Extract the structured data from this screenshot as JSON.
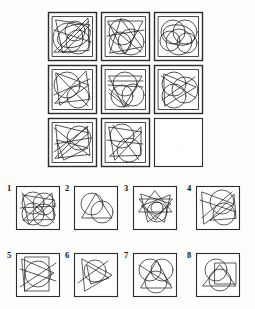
{
  "puzzle": {
    "type": "visual-analogy-matrix",
    "title": "Raven-style progressive matrix with eight answer options",
    "stroke_color": "#1d1d1d",
    "box_fill": "#ffffff",
    "background_color": "#fdfdfb",
    "matrix": {
      "rows": 3,
      "cols": 3,
      "origin": {
        "x": 48,
        "y": 12
      },
      "cell_size": 49,
      "gap": 4,
      "cells": [
        {
          "id": "r1c1",
          "row": 1,
          "col": 1,
          "empty": false,
          "description": "Dense overlay: large square border, big left circle, two mid circles, downward triangle and long diagonals",
          "shapes": [
            {
              "kind": "rect",
              "x": 5,
              "y": 5,
              "w": 39,
              "h": 39
            },
            {
              "kind": "circle",
              "cx": 20,
              "cy": 26,
              "r": 15
            },
            {
              "kind": "circle",
              "cx": 30,
              "cy": 30,
              "r": 12
            },
            {
              "kind": "circle",
              "cx": 27,
              "cy": 19,
              "r": 10
            },
            {
              "kind": "ellipse",
              "cx": 26,
              "cy": 24,
              "rx": 17,
              "ry": 11,
              "rot": -18
            },
            {
              "kind": "poly",
              "pts": "8,8 42,13 15,41"
            },
            {
              "kind": "poly",
              "pts": "6,40 40,6 41,38"
            },
            {
              "kind": "line",
              "x1": 6,
              "y1": 18,
              "x2": 43,
              "y2": 30
            },
            {
              "kind": "line",
              "x1": 10,
              "y1": 40,
              "x2": 41,
              "y2": 9
            }
          ]
        },
        {
          "id": "r1c2",
          "row": 1,
          "col": 2,
          "empty": false,
          "description": "Square with three large overlapping circles, an inverted triangle and crossing chords",
          "shapes": [
            {
              "kind": "rect",
              "x": 5,
              "y": 5,
              "w": 39,
              "h": 39
            },
            {
              "kind": "circle",
              "cx": 21,
              "cy": 20,
              "r": 13
            },
            {
              "kind": "circle",
              "cx": 30,
              "cy": 30,
              "r": 13
            },
            {
              "kind": "circle",
              "cx": 19,
              "cy": 31,
              "r": 11
            },
            {
              "kind": "poly",
              "pts": "7,9 42,9 24,42"
            },
            {
              "kind": "poly",
              "pts": "9,41 41,35 20,7"
            },
            {
              "kind": "line",
              "x1": 6,
              "y1": 24,
              "x2": 43,
              "y2": 18
            },
            {
              "kind": "line",
              "x1": 7,
              "y1": 12,
              "x2": 40,
              "y2": 40
            }
          ]
        },
        {
          "id": "r1c3",
          "row": 1,
          "col": 3,
          "empty": false,
          "description": "Square filled with five overlapping circles only, no straight lines",
          "shapes": [
            {
              "kind": "rect",
              "x": 5,
              "y": 5,
              "w": 39,
              "h": 39
            },
            {
              "kind": "circle",
              "cx": 19,
              "cy": 20,
              "r": 12
            },
            {
              "kind": "circle",
              "cx": 31,
              "cy": 20,
              "r": 12
            },
            {
              "kind": "circle",
              "cx": 25,
              "cy": 30,
              "r": 13
            },
            {
              "kind": "circle",
              "cx": 16,
              "cy": 29,
              "r": 10
            },
            {
              "kind": "circle",
              "cx": 33,
              "cy": 31,
              "r": 10
            },
            {
              "kind": "ellipse",
              "cx": 25,
              "cy": 23,
              "rx": 16,
              "ry": 10,
              "rot": 12
            }
          ]
        },
        {
          "id": "r2c1",
          "row": 2,
          "col": 1,
          "empty": false,
          "description": "Square, large upper-left circle, right-pointing triangle, long diagonal slashes",
          "shapes": [
            {
              "kind": "rect",
              "x": 5,
              "y": 5,
              "w": 39,
              "h": 39
            },
            {
              "kind": "circle",
              "cx": 19,
              "cy": 20,
              "r": 13
            },
            {
              "kind": "circle",
              "cx": 30,
              "cy": 32,
              "r": 11
            },
            {
              "kind": "poly",
              "pts": "8,8 41,20 12,40"
            },
            {
              "kind": "poly",
              "pts": "7,38 38,6 42,34"
            },
            {
              "kind": "line",
              "x1": 6,
              "y1": 30,
              "x2": 42,
              "y2": 14
            },
            {
              "kind": "line",
              "x1": 9,
              "y1": 9,
              "x2": 40,
              "y2": 41
            }
          ]
        },
        {
          "id": "r2c2",
          "row": 2,
          "col": 2,
          "empty": false,
          "description": "Square with two stacked circles, a narrow V triangle and a bundle of near-parallel diagonals",
          "shapes": [
            {
              "kind": "rect",
              "x": 5,
              "y": 5,
              "w": 39,
              "h": 39
            },
            {
              "kind": "circle",
              "cx": 24,
              "cy": 19,
              "r": 12
            },
            {
              "kind": "circle",
              "cx": 21,
              "cy": 31,
              "r": 11
            },
            {
              "kind": "circle",
              "cx": 32,
              "cy": 30,
              "r": 11
            },
            {
              "kind": "poly",
              "pts": "8,11 41,11 23,42"
            },
            {
              "kind": "line",
              "x1": 7,
              "y1": 16,
              "x2": 42,
              "y2": 16
            },
            {
              "kind": "line",
              "x1": 7,
              "y1": 20,
              "x2": 42,
              "y2": 22
            },
            {
              "kind": "line",
              "x1": 8,
              "y1": 24,
              "x2": 28,
              "y2": 42
            },
            {
              "kind": "line",
              "x1": 8,
              "y1": 28,
              "x2": 26,
              "y2": 42
            }
          ]
        },
        {
          "id": "r2c3",
          "row": 2,
          "col": 3,
          "empty": false,
          "description": "Square, four overlapping circles stacked left, plus a right-facing triangle and diagonals",
          "shapes": [
            {
              "kind": "rect",
              "x": 5,
              "y": 5,
              "w": 39,
              "h": 39
            },
            {
              "kind": "circle",
              "cx": 20,
              "cy": 19,
              "r": 12
            },
            {
              "kind": "circle",
              "cx": 20,
              "cy": 31,
              "r": 12
            },
            {
              "kind": "circle",
              "cx": 31,
              "cy": 25,
              "r": 13
            },
            {
              "kind": "poly",
              "pts": "10,9 42,22 11,41"
            },
            {
              "kind": "line",
              "x1": 7,
              "y1": 11,
              "x2": 42,
              "y2": 33
            },
            {
              "kind": "line",
              "x1": 8,
              "y1": 35,
              "x2": 41,
              "y2": 12
            }
          ]
        },
        {
          "id": "r3c1",
          "row": 3,
          "col": 1,
          "empty": false,
          "description": "Square with many crossing straight lines forming zig-zags, one circle at right",
          "shapes": [
            {
              "kind": "rect",
              "x": 5,
              "y": 5,
              "w": 39,
              "h": 39
            },
            {
              "kind": "circle",
              "cx": 31,
              "cy": 20,
              "r": 12
            },
            {
              "kind": "poly",
              "pts": "8,7 41,15 11,40"
            },
            {
              "kind": "poly",
              "pts": "7,40 39,8 42,36"
            },
            {
              "kind": "poly",
              "pts": "9,22 40,30 16,42"
            },
            {
              "kind": "line",
              "x1": 6,
              "y1": 10,
              "x2": 42,
              "y2": 38
            },
            {
              "kind": "line",
              "x1": 6,
              "y1": 34,
              "x2": 40,
              "y2": 9
            },
            {
              "kind": "line",
              "x1": 7,
              "y1": 26,
              "x2": 42,
              "y2": 20
            }
          ]
        },
        {
          "id": "r3c2",
          "row": 3,
          "col": 2,
          "empty": false,
          "description": "Square, upper circle, lower circle, triangle and crossing lines forming a knot",
          "shapes": [
            {
              "kind": "rect",
              "x": 5,
              "y": 5,
              "w": 39,
              "h": 39
            },
            {
              "kind": "circle",
              "cx": 21,
              "cy": 18,
              "r": 12
            },
            {
              "kind": "circle",
              "cx": 28,
              "cy": 32,
              "r": 12
            },
            {
              "kind": "poly",
              "pts": "8,9 41,14 14,42"
            },
            {
              "kind": "poly",
              "pts": "9,38 40,9 40,37"
            },
            {
              "kind": "line",
              "x1": 6,
              "y1": 22,
              "x2": 42,
              "y2": 26
            },
            {
              "kind": "line",
              "x1": 12,
              "y1": 7,
              "x2": 38,
              "y2": 42
            }
          ]
        },
        {
          "id": "r3c3",
          "row": 3,
          "col": 3,
          "empty": true,
          "description": "Empty cell — the missing element to be chosen from the options",
          "shapes": [
            {
              "kind": "rect",
              "x": 3,
              "y": 3,
              "w": 43,
              "h": 43
            }
          ]
        }
      ]
    },
    "options": {
      "count": 8,
      "rows": 2,
      "cols": 4,
      "cell_size": 44,
      "labels": [
        "1",
        "2",
        "3",
        "4",
        "5",
        "6",
        "7",
        "8"
      ],
      "items": [
        {
          "label": "1",
          "x": 16,
          "y": 186,
          "description": "Very dense: four overlapping circles plus several crossing triangles and lines",
          "shapes": [
            {
              "kind": "rect",
              "x": 2,
              "y": 2,
              "w": 40,
              "h": 40
            },
            {
              "kind": "circle",
              "cx": 17,
              "cy": 17,
              "r": 11
            },
            {
              "kind": "circle",
              "cx": 28,
              "cy": 18,
              "r": 11
            },
            {
              "kind": "circle",
              "cx": 17,
              "cy": 28,
              "r": 11
            },
            {
              "kind": "circle",
              "cx": 28,
              "cy": 29,
              "r": 11
            },
            {
              "kind": "poly",
              "pts": "7,9 38,14 13,38"
            },
            {
              "kind": "poly",
              "pts": "7,34 36,7 38,33"
            },
            {
              "kind": "line",
              "x1": 4,
              "y1": 22,
              "x2": 40,
              "y2": 20
            },
            {
              "kind": "line",
              "x1": 6,
              "y1": 7,
              "x2": 38,
              "y2": 37
            }
          ]
        },
        {
          "label": "2",
          "x": 74,
          "y": 186,
          "description": "Simple: one triangle and two overlapping circles",
          "shapes": [
            {
              "kind": "rect",
              "x": 2,
              "y": 2,
              "w": 40,
              "h": 40
            },
            {
              "kind": "circle",
              "cx": 18,
              "cy": 18,
              "r": 11
            },
            {
              "kind": "circle",
              "cx": 28,
              "cy": 26,
              "r": 11
            },
            {
              "kind": "poly",
              "pts": "22,8 38,32 8,32"
            }
          ]
        },
        {
          "label": "3",
          "x": 133,
          "y": 186,
          "description": "Star of overlapping triangles with two circles below",
          "shapes": [
            {
              "kind": "rect",
              "x": 2,
              "y": 2,
              "w": 40,
              "h": 40
            },
            {
              "kind": "circle",
              "cx": 24,
              "cy": 26,
              "r": 10
            },
            {
              "kind": "circle",
              "cx": 24,
              "cy": 22,
              "r": 6
            },
            {
              "kind": "poly",
              "pts": "22,5 39,26 6,26"
            },
            {
              "kind": "poly",
              "pts": "22,34 6,13 39,13"
            },
            {
              "kind": "poly",
              "pts": "8,8 38,18 15,36"
            },
            {
              "kind": "poly",
              "pts": "37,9 8,20 31,36"
            }
          ]
        },
        {
          "label": "4",
          "x": 196,
          "y": 186,
          "description": "Square with two big circles, a left-pointing triangle and crossing chords",
          "shapes": [
            {
              "kind": "rect",
              "x": 2,
              "y": 2,
              "w": 40,
              "h": 40
            },
            {
              "kind": "circle",
              "cx": 26,
              "cy": 16,
              "r": 12
            },
            {
              "kind": "circle",
              "cx": 28,
              "cy": 28,
              "r": 11
            },
            {
              "kind": "poly",
              "pts": "6,6 38,18 8,38"
            },
            {
              "kind": "poly",
              "pts": "14,34 38,8 40,32"
            },
            {
              "kind": "line",
              "x1": 4,
              "y1": 14,
              "x2": 40,
              "y2": 26
            },
            {
              "kind": "line",
              "x1": 6,
              "y1": 32,
              "x2": 36,
              "y2": 6
            }
          ]
        },
        {
          "label": "5",
          "x": 16,
          "y": 253,
          "description": "Square with one big circle, an inner rectangle, a triangle and long diagonals",
          "shapes": [
            {
              "kind": "rect",
              "x": 2,
              "y": 2,
              "w": 40,
              "h": 40
            },
            {
              "kind": "circle",
              "cx": 22,
              "cy": 21,
              "r": 13
            },
            {
              "kind": "rect",
              "x": 9,
              "y": 4,
              "w": 24,
              "h": 34
            },
            {
              "kind": "poly",
              "pts": "6,6 38,20 9,38"
            },
            {
              "kind": "line",
              "x1": 4,
              "y1": 34,
              "x2": 40,
              "y2": 10
            },
            {
              "kind": "line",
              "x1": 4,
              "y1": 16,
              "x2": 40,
              "y2": 28
            }
          ]
        },
        {
          "label": "6",
          "x": 74,
          "y": 253,
          "description": "Square with one circle, a large triangle and a smaller inner triangle",
          "shapes": [
            {
              "kind": "rect",
              "x": 2,
              "y": 2,
              "w": 40,
              "h": 40
            },
            {
              "kind": "circle",
              "cx": 21,
              "cy": 18,
              "r": 11
            },
            {
              "kind": "poly",
              "pts": "8,6 38,22 11,38"
            },
            {
              "kind": "poly",
              "pts": "13,12 35,25 17,31"
            },
            {
              "kind": "line",
              "x1": 4,
              "y1": 30,
              "x2": 34,
              "y2": 8
            }
          ]
        },
        {
          "label": "7",
          "x": 133,
          "y": 253,
          "description": "Square with three overlapping circles and a wide triangle",
          "shapes": [
            {
              "kind": "rect",
              "x": 2,
              "y": 2,
              "w": 40,
              "h": 40
            },
            {
              "kind": "circle",
              "cx": 17,
              "cy": 17,
              "r": 11
            },
            {
              "kind": "circle",
              "cx": 29,
              "cy": 17,
              "r": 11
            },
            {
              "kind": "circle",
              "cx": 23,
              "cy": 29,
              "r": 11
            },
            {
              "kind": "poly",
              "pts": "24,8 39,35 8,35"
            },
            {
              "kind": "line",
              "x1": 6,
              "y1": 12,
              "x2": 38,
              "y2": 32
            }
          ]
        },
        {
          "label": "8",
          "x": 196,
          "y": 253,
          "description": "Square with two overlapping circles, an inner square and a triangle",
          "shapes": [
            {
              "kind": "rect",
              "x": 2,
              "y": 2,
              "w": 40,
              "h": 40
            },
            {
              "kind": "circle",
              "cx": 20,
              "cy": 17,
              "r": 11
            },
            {
              "kind": "circle",
              "cx": 24,
              "cy": 27,
              "r": 11
            },
            {
              "kind": "rect",
              "x": 19,
              "y": 10,
              "w": 21,
              "h": 21
            },
            {
              "kind": "poly",
              "pts": "24,12 40,33 7,33"
            }
          ]
        }
      ]
    }
  }
}
